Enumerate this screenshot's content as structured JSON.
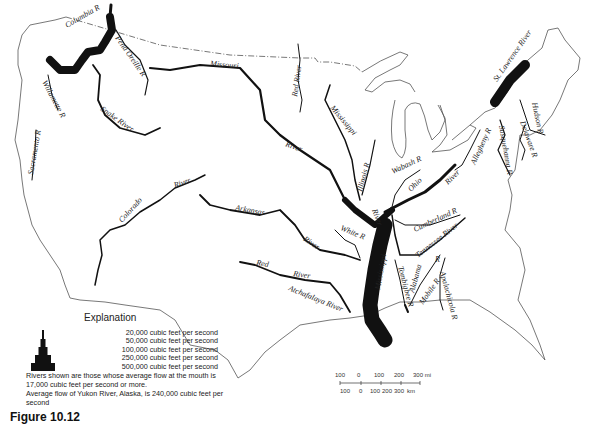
{
  "map": {
    "title": "Major rivers of the conterminous United States by average flow",
    "rivers": [
      {
        "label": "Columbia R",
        "width_class": "100,000"
      },
      {
        "label": "Pend Oreille R",
        "width_class": "20,000"
      },
      {
        "label": "Willamette R",
        "width_class": "20,000"
      },
      {
        "label": "Snake River",
        "width_class": "50,000"
      },
      {
        "label": "Sacramento R",
        "width_class": "20,000"
      },
      {
        "label": "Missouri",
        "width_class": "50,000"
      },
      {
        "label": "River",
        "width_class": "50,000"
      },
      {
        "label": "Red River",
        "width_class": "20,000"
      },
      {
        "label": "Mississippi",
        "width_class": "20,000"
      },
      {
        "label": "Colorado",
        "width_class": "20,000"
      },
      {
        "label": "River",
        "width_class": "20,000"
      },
      {
        "label": "Arkansas",
        "width_class": "50,000"
      },
      {
        "label": "River",
        "width_class": "50,000"
      },
      {
        "label": "Red",
        "width_class": "50,000"
      },
      {
        "label": "River",
        "width_class": "50,000"
      },
      {
        "label": "Atchafalaya River",
        "width_class": "50,000"
      },
      {
        "label": "White R",
        "width_class": "20,000"
      },
      {
        "label": "Illinois R",
        "width_class": "20,000"
      },
      {
        "label": "Wabash R",
        "width_class": "20,000"
      },
      {
        "label": "Ohio",
        "width_class": "100,000"
      },
      {
        "label": "River",
        "width_class": "100,000"
      },
      {
        "label": "River",
        "width_class": "250,000"
      },
      {
        "label": "Cumberland R",
        "width_class": "20,000"
      },
      {
        "label": "Tennessee River",
        "width_class": "50,000"
      },
      {
        "label": "Mississippi",
        "width_class": "500,000"
      },
      {
        "label": "Tombigbee R",
        "width_class": "20,000"
      },
      {
        "label": "Alabama",
        "width_class": "20,000"
      },
      {
        "label": "R",
        "width_class": "20,000"
      },
      {
        "label": "Mobile R",
        "width_class": "50,000"
      },
      {
        "label": "Apalachicola R",
        "width_class": "20,000"
      },
      {
        "label": "Allegheny R",
        "width_class": "20,000"
      },
      {
        "label": "Susquehanna R",
        "width_class": "20,000"
      },
      {
        "label": "Delaware R",
        "width_class": "20,000"
      },
      {
        "label": "Hudson R",
        "width_class": "20,000"
      },
      {
        "label": "St. Lawrence River",
        "width_class": "250,000"
      }
    ],
    "line_color": "#111111",
    "border_color": "#555555",
    "background": "#ffffff"
  },
  "legend": {
    "title": "Explanation",
    "rows": [
      "20,000 cubic feet per second",
      "50,000 cubic feet per second",
      "100,000 cubic feet per second",
      "250,000 cubic feet per second",
      "500,000 cubic feet per second"
    ],
    "note1": "Rivers shown are those whose average flow at the mouth is 17,000 cubic feet per second or more.",
    "note2": "Average flow of Yukon River, Alaska, is 240,000 cubic feet per second"
  },
  "scale": {
    "miles": [
      "100",
      "0",
      "100",
      "200",
      "300 mi"
    ],
    "km": [
      "100",
      "0",
      "100",
      "200",
      "300",
      "km"
    ]
  },
  "figure": {
    "label": "Figure 10.12"
  }
}
